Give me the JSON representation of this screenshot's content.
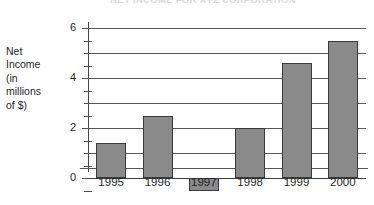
{
  "chart_data": {
    "type": "bar",
    "title": "NET INCOME FOR XYZ CORPORATION",
    "categories": [
      "1995",
      "1996",
      "1997",
      "1998",
      "1999",
      "2000"
    ],
    "values": [
      1.4,
      2.5,
      -0.5,
      2.0,
      4.6,
      5.5
    ],
    "xlabel": "",
    "ylabel": "Net Income (in millions of $)",
    "ylim": [
      -1,
      6
    ],
    "ytick_labels": [
      "6",
      "4",
      "2",
      "0"
    ],
    "ytick_values": [
      6,
      4,
      2,
      0
    ],
    "gridline_values": [
      6,
      5,
      4,
      3,
      2,
      1,
      0
    ],
    "minor_tick_step": 0.5,
    "grid": true,
    "legend": false,
    "bar_color": "#8a8a8a",
    "bar_edge_color": "#3a3a3a",
    "grid_color": "#55585c",
    "background": "#ffffff"
  },
  "y_axis_caption_lines": [
    "Net",
    "Income",
    "(in",
    "millions",
    "of $)"
  ]
}
